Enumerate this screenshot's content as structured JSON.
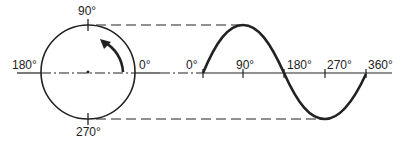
{
  "diagram": {
    "type": "phasor-to-sine-projection",
    "circle_labels": {
      "top": "90°",
      "left": "180°",
      "right": "0°",
      "bottom": "270°"
    },
    "wave_axis_labels": [
      "0°",
      "90°",
      "180°",
      "270°",
      "360°"
    ],
    "rotation_direction": "counterclockwise",
    "colors": {
      "stroke": "#222222",
      "background": "#ffffff"
    }
  }
}
